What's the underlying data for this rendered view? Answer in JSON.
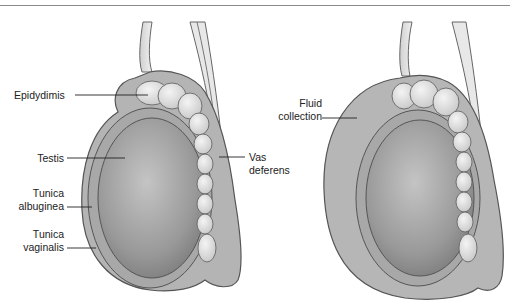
{
  "figure": {
    "panels": [
      {
        "id": "normal",
        "labels": {
          "epididymis": "Epidydimis",
          "testis": "Testis",
          "tunica_albuginea_1": "Tunica",
          "tunica_albuginea_2": "albuginea",
          "tunica_vaginalis_1": "Tunica",
          "tunica_vaginalis_2": "vaginalis",
          "vas_deferens_1": "Vas",
          "vas_deferens_2": "deferens"
        }
      },
      {
        "id": "hydrocele",
        "labels": {
          "fluid_1": "Fluid",
          "fluid_2": "collection"
        }
      }
    ],
    "colors": {
      "outline": "#555555",
      "tissue": "#b8b8b8",
      "testis": "#9a9a9a",
      "epididymis": "#e6e6e6",
      "rule": "#8a8a8a"
    }
  }
}
